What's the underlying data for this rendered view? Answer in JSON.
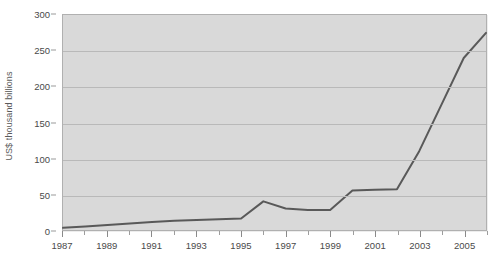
{
  "chart_data": {
    "type": "line",
    "title": "",
    "xlabel": "",
    "ylabel": "US$ thousand billions",
    "xlim": [
      1987,
      2006
    ],
    "ylim": [
      0,
      300
    ],
    "ytick_values": [
      0,
      50,
      100,
      150,
      200,
      250,
      300
    ],
    "ytick_labels": [
      "0",
      "50",
      "100",
      "150",
      "200",
      "250",
      "300"
    ],
    "xtick_values": [
      1987,
      1989,
      1991,
      1993,
      1995,
      1997,
      1999,
      2001,
      2003,
      2005
    ],
    "xtick_labels": [
      "1987",
      "1989",
      "1991",
      "1993",
      "1995",
      "1997",
      "1999",
      "2001",
      "2003",
      "2005"
    ],
    "minor_xticks": [
      1988,
      1990,
      1992,
      1994,
      1996,
      1998,
      2000,
      2002,
      2004,
      2006
    ],
    "grid": "horizontal",
    "legend": "none",
    "x": [
      1987,
      1988,
      1989,
      1990,
      1991,
      1992,
      1993,
      1994,
      1995,
      1996,
      1997,
      1998,
      1999,
      2000,
      2001,
      2002,
      2003,
      2004,
      2005,
      2006
    ],
    "values": [
      3,
      5,
      7,
      9,
      11,
      13,
      14,
      15,
      16,
      40,
      30,
      28,
      28,
      55,
      56,
      57,
      110,
      175,
      240,
      275
    ],
    "series": [
      {
        "name": "US$ thousand billions",
        "values": [
          3,
          5,
          7,
          9,
          11,
          13,
          14,
          15,
          16,
          40,
          30,
          28,
          28,
          55,
          56,
          57,
          110,
          175,
          240,
          275
        ]
      }
    ],
    "colors": {
      "line": "#595959",
      "plot_background": "#d9d9d9",
      "gridline": "#b9b9b9",
      "plot_border": "#b0b0b0",
      "text": "#4a4a4a",
      "page_background": "#ffffff"
    },
    "line_width": 2
  }
}
